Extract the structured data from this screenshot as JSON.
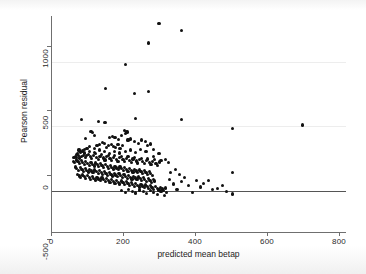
{
  "chart_data": {
    "type": "scatter",
    "title": "",
    "xlabel": "predicted mean betap",
    "ylabel": "Pearson residual",
    "xlim": [
      0,
      820
    ],
    "ylim": [
      -520,
      1160
    ],
    "xticks": [
      0,
      200,
      400,
      600,
      800
    ],
    "xtick_labels": [
      "0",
      "200",
      "400",
      "600",
      "800"
    ],
    "yticks": [
      -500,
      0,
      500,
      1000
    ],
    "ytick_labels": [
      "-500",
      "0",
      "500",
      "1000"
    ],
    "grid": "horizontal-faint",
    "legend": "none",
    "reference_line": {
      "axis": "y",
      "value": 0,
      "color": "#555555"
    },
    "marker": {
      "shape": "circle",
      "color": "#111111",
      "size": 3.2
    },
    "points": [
      [
        300,
        1100
      ],
      [
        363,
        1045
      ],
      [
        272,
        950
      ],
      [
        207,
        785
      ],
      [
        152,
        598
      ],
      [
        231,
        560
      ],
      [
        272,
        573
      ],
      [
        362,
        355
      ],
      [
        700,
        312
      ],
      [
        505,
        288
      ],
      [
        236,
        360
      ],
      [
        131,
        340
      ],
      [
        150,
        330
      ],
      [
        85,
        352
      ],
      [
        204,
        268
      ],
      [
        211,
        258
      ],
      [
        207,
        245
      ],
      [
        111,
        262
      ],
      [
        115,
        252
      ],
      [
        120,
        228
      ],
      [
        95,
        205
      ],
      [
        163,
        218
      ],
      [
        170,
        224
      ],
      [
        178,
        212
      ],
      [
        188,
        200
      ],
      [
        196,
        232
      ],
      [
        214,
        195
      ],
      [
        222,
        204
      ],
      [
        232,
        186
      ],
      [
        243,
        168
      ],
      [
        252,
        196
      ],
      [
        263,
        182
      ],
      [
        268,
        150
      ],
      [
        276,
        165
      ],
      [
        286,
        120
      ],
      [
        160,
        155
      ],
      [
        168,
        162
      ],
      [
        174,
        148
      ],
      [
        180,
        140
      ],
      [
        186,
        158
      ],
      [
        192,
        132
      ],
      [
        198,
        150
      ],
      [
        143,
        178
      ],
      [
        149,
        168
      ],
      [
        155,
        140
      ],
      [
        128,
        150
      ],
      [
        134,
        160
      ],
      [
        122,
        132
      ],
      [
        108,
        142
      ],
      [
        100,
        128
      ],
      [
        93,
        120
      ],
      [
        88,
        110
      ],
      [
        82,
        96
      ],
      [
        78,
        118
      ],
      [
        74,
        90
      ],
      [
        70,
        82
      ],
      [
        67,
        70
      ],
      [
        64,
        58
      ],
      [
        72,
        62
      ],
      [
        76,
        72
      ],
      [
        80,
        55
      ],
      [
        85,
        66
      ],
      [
        90,
        78
      ],
      [
        95,
        60
      ],
      [
        99,
        72
      ],
      [
        104,
        84
      ],
      [
        109,
        66
      ],
      [
        113,
        52
      ],
      [
        118,
        74
      ],
      [
        123,
        88
      ],
      [
        127,
        60
      ],
      [
        132,
        46
      ],
      [
        136,
        70
      ],
      [
        141,
        84
      ],
      [
        145,
        56
      ],
      [
        150,
        40
      ],
      [
        154,
        66
      ],
      [
        159,
        78
      ],
      [
        164,
        50
      ],
      [
        168,
        36
      ],
      [
        173,
        62
      ],
      [
        177,
        74
      ],
      [
        182,
        46
      ],
      [
        186,
        30
      ],
      [
        191,
        58
      ],
      [
        195,
        70
      ],
      [
        200,
        42
      ],
      [
        205,
        28
      ],
      [
        209,
        54
      ],
      [
        214,
        66
      ],
      [
        218,
        38
      ],
      [
        223,
        22
      ],
      [
        228,
        48
      ],
      [
        232,
        60
      ],
      [
        237,
        32
      ],
      [
        241,
        16
      ],
      [
        246,
        42
      ],
      [
        251,
        54
      ],
      [
        255,
        26
      ],
      [
        260,
        10
      ],
      [
        265,
        36
      ],
      [
        269,
        48
      ],
      [
        274,
        20
      ],
      [
        278,
        4
      ],
      [
        283,
        30
      ],
      [
        288,
        42
      ],
      [
        292,
        14
      ],
      [
        297,
        -2
      ],
      [
        302,
        24
      ],
      [
        306,
        36
      ],
      [
        62,
        30
      ],
      [
        66,
        18
      ],
      [
        71,
        40
      ],
      [
        75,
        26
      ],
      [
        79,
        12
      ],
      [
        84,
        34
      ],
      [
        88,
        20
      ],
      [
        93,
        6
      ],
      [
        97,
        28
      ],
      [
        102,
        14
      ],
      [
        106,
        0
      ],
      [
        111,
        22
      ],
      [
        115,
        8
      ],
      [
        120,
        -6
      ],
      [
        124,
        16
      ],
      [
        129,
        2
      ],
      [
        133,
        -12
      ],
      [
        138,
        10
      ],
      [
        142,
        -4
      ],
      [
        147,
        -18
      ],
      [
        151,
        4
      ],
      [
        156,
        -10
      ],
      [
        160,
        -24
      ],
      [
        165,
        -2
      ],
      [
        169,
        -16
      ],
      [
        174,
        -30
      ],
      [
        178,
        -8
      ],
      [
        183,
        -22
      ],
      [
        187,
        -36
      ],
      [
        192,
        -14
      ],
      [
        196,
        -28
      ],
      [
        201,
        -42
      ],
      [
        205,
        -20
      ],
      [
        210,
        -34
      ],
      [
        214,
        -48
      ],
      [
        219,
        -26
      ],
      [
        223,
        -40
      ],
      [
        228,
        -54
      ],
      [
        232,
        -32
      ],
      [
        237,
        -46
      ],
      [
        241,
        -60
      ],
      [
        246,
        -38
      ],
      [
        250,
        -52
      ],
      [
        255,
        -66
      ],
      [
        259,
        -44
      ],
      [
        264,
        -58
      ],
      [
        268,
        -72
      ],
      [
        273,
        -50
      ],
      [
        277,
        -64
      ],
      [
        282,
        -78
      ],
      [
        68,
        -14
      ],
      [
        72,
        -28
      ],
      [
        77,
        -42
      ],
      [
        81,
        -20
      ],
      [
        86,
        -34
      ],
      [
        90,
        -48
      ],
      [
        95,
        -26
      ],
      [
        99,
        -40
      ],
      [
        104,
        -54
      ],
      [
        108,
        -32
      ],
      [
        113,
        -46
      ],
      [
        117,
        -60
      ],
      [
        122,
        -38
      ],
      [
        126,
        -52
      ],
      [
        131,
        -66
      ],
      [
        135,
        -44
      ],
      [
        140,
        -58
      ],
      [
        144,
        -72
      ],
      [
        149,
        -50
      ],
      [
        153,
        -64
      ],
      [
        158,
        -78
      ],
      [
        162,
        -56
      ],
      [
        167,
        -70
      ],
      [
        171,
        -84
      ],
      [
        176,
        -62
      ],
      [
        180,
        -76
      ],
      [
        185,
        -90
      ],
      [
        189,
        -68
      ],
      [
        194,
        -82
      ],
      [
        198,
        -96
      ],
      [
        203,
        -74
      ],
      [
        207,
        -88
      ],
      [
        212,
        -102
      ],
      [
        216,
        -80
      ],
      [
        221,
        -94
      ],
      [
        225,
        -108
      ],
      [
        230,
        -86
      ],
      [
        234,
        -100
      ],
      [
        239,
        -114
      ],
      [
        243,
        -92
      ],
      [
        248,
        -106
      ],
      [
        252,
        -120
      ],
      [
        257,
        -98
      ],
      [
        261,
        -112
      ],
      [
        266,
        -126
      ],
      [
        270,
        -104
      ],
      [
        275,
        -118
      ],
      [
        279,
        -132
      ],
      [
        284,
        -110
      ],
      [
        288,
        -124
      ],
      [
        74,
        -70
      ],
      [
        79,
        -84
      ],
      [
        83,
        -98
      ],
      [
        88,
        -76
      ],
      [
        92,
        -90
      ],
      [
        97,
        -104
      ],
      [
        101,
        -82
      ],
      [
        106,
        -96
      ],
      [
        110,
        -110
      ],
      [
        115,
        -88
      ],
      [
        119,
        -102
      ],
      [
        124,
        -116
      ],
      [
        128,
        -94
      ],
      [
        133,
        -108
      ],
      [
        137,
        -122
      ],
      [
        142,
        -100
      ],
      [
        146,
        -114
      ],
      [
        151,
        -128
      ],
      [
        155,
        -106
      ],
      [
        160,
        -120
      ],
      [
        164,
        -134
      ],
      [
        169,
        -112
      ],
      [
        173,
        -126
      ],
      [
        178,
        -140
      ],
      [
        182,
        -118
      ],
      [
        187,
        -132
      ],
      [
        191,
        -146
      ],
      [
        196,
        -124
      ],
      [
        200,
        -138
      ],
      [
        205,
        -152
      ],
      [
        209,
        -130
      ],
      [
        214,
        -144
      ],
      [
        218,
        -158
      ],
      [
        223,
        -136
      ],
      [
        227,
        -150
      ],
      [
        232,
        -164
      ],
      [
        236,
        -142
      ],
      [
        241,
        -156
      ],
      [
        245,
        -170
      ],
      [
        250,
        -148
      ],
      [
        254,
        -162
      ],
      [
        259,
        -176
      ],
      [
        263,
        -154
      ],
      [
        268,
        -168
      ],
      [
        272,
        -182
      ],
      [
        277,
        -160
      ],
      [
        281,
        -174
      ],
      [
        286,
        -188
      ],
      [
        290,
        -166
      ],
      [
        295,
        -180
      ],
      [
        300,
        -194
      ],
      [
        304,
        -172
      ],
      [
        309,
        -186
      ],
      [
        313,
        -200
      ],
      [
        318,
        -178
      ],
      [
        196,
        -196
      ],
      [
        206,
        -210
      ],
      [
        216,
        -188
      ],
      [
        226,
        -202
      ],
      [
        236,
        -216
      ],
      [
        246,
        -194
      ],
      [
        256,
        -208
      ],
      [
        266,
        -222
      ],
      [
        276,
        -200
      ],
      [
        286,
        -214
      ],
      [
        296,
        -228
      ],
      [
        306,
        -206
      ],
      [
        316,
        -234
      ],
      [
        322,
        -212
      ],
      [
        330,
        -110
      ],
      [
        340,
        -146
      ],
      [
        350,
        -190
      ],
      [
        362,
        -128
      ],
      [
        372,
        -96
      ],
      [
        383,
        -160
      ],
      [
        393,
        -212
      ],
      [
        404,
        -118
      ],
      [
        415,
        -170
      ],
      [
        425,
        -140
      ],
      [
        437,
        -122
      ],
      [
        449,
        -192
      ],
      [
        462,
        -180
      ],
      [
        476,
        -158
      ],
      [
        488,
        -206
      ],
      [
        505,
        -225
      ],
      [
        505,
        -58
      ],
      [
        332,
        -60
      ],
      [
        345,
        -36
      ],
      [
        357,
        -74
      ],
      [
        318,
        42
      ],
      [
        326,
        20
      ],
      [
        300,
        88
      ],
      [
        286,
        66
      ],
      [
        264,
        104
      ],
      [
        248,
        122
      ],
      [
        236,
        96
      ],
      [
        222,
        118
      ],
      [
        206,
        106
      ],
      [
        190,
        94
      ],
      [
        176,
        108
      ],
      [
        162,
        92
      ],
      [
        148,
        104
      ],
      [
        134,
        118
      ],
      [
        120,
        96
      ],
      [
        106,
        108
      ],
      [
        92,
        94
      ],
      [
        80,
        104
      ]
    ]
  },
  "axis": {
    "x_title": "predicted mean betap",
    "y_title": "Pearson residual"
  }
}
